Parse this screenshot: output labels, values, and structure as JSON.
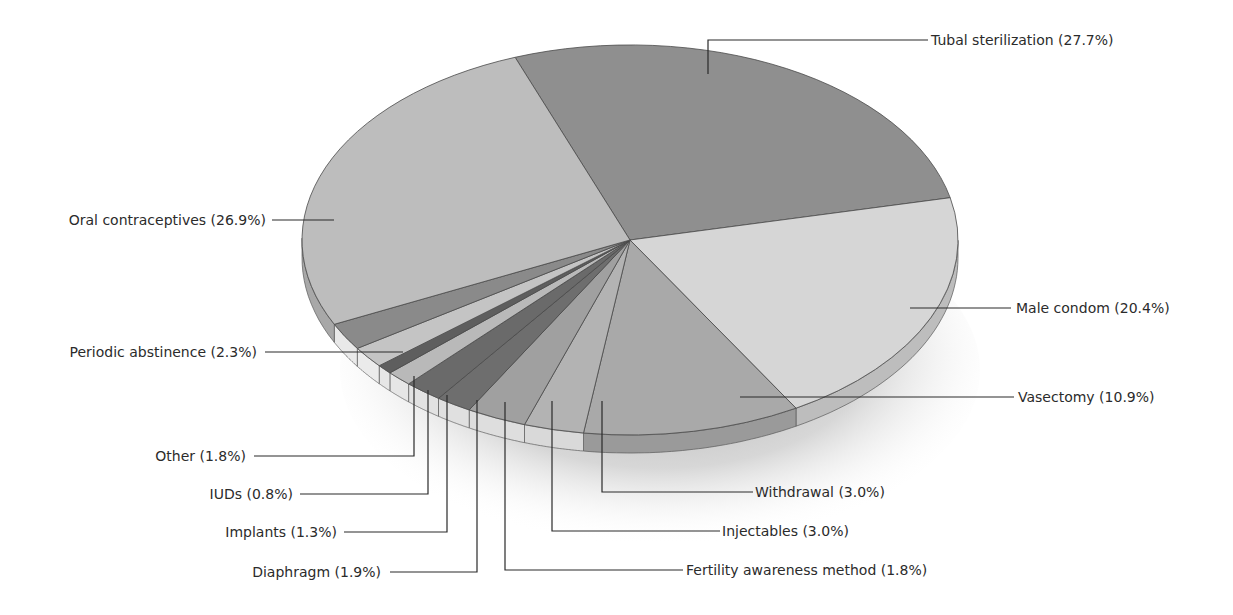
{
  "chart_data": {
    "type": "pie",
    "style": "3d-exploded-perspective",
    "title": "",
    "slices": [
      {
        "label": "Tubal sterilization",
        "value": 27.7,
        "display": "Tubal sterilization (27.7%)",
        "color": "#8f8f8f",
        "side": "#7a7a7a"
      },
      {
        "label": "Male condom",
        "value": 20.4,
        "display": "Male condom (20.4%)",
        "color": "#d6d6d6",
        "side": "#bdbdbd"
      },
      {
        "label": "Vasectomy",
        "value": 10.9,
        "display": "Vasectomy (10.9%)",
        "color": "#a9a9a9",
        "side": "#9a9a9a"
      },
      {
        "label": "Withdrawal",
        "value": 3.0,
        "display": "Withdrawal (3.0%)",
        "color": "#b3b3b3",
        "side": "#d9d9d9"
      },
      {
        "label": "Injectables",
        "value": 3.0,
        "display": "Injectables (3.0%)",
        "color": "#a0a0a0",
        "side": "#dedede"
      },
      {
        "label": "Fertility awareness method",
        "value": 1.8,
        "display": "Fertility awareness method (1.8%)",
        "color": "#6e6e6e",
        "side": "#e0e0e0"
      },
      {
        "label": "Diaphragm",
        "value": 1.9,
        "display": "Diaphragm (1.9%)",
        "color": "#6a6a6a",
        "side": "#e2e2e2"
      },
      {
        "label": "Implants",
        "value": 1.3,
        "display": "Implants (1.3%)",
        "color": "#b9b9b9",
        "side": "#e6e6e6"
      },
      {
        "label": "IUDs",
        "value": 0.8,
        "display": "IUDs (0.8%)",
        "color": "#5e5e5e",
        "side": "#e6e6e6"
      },
      {
        "label": "Other",
        "value": 1.8,
        "display": "Other (1.8%)",
        "color": "#c4c4c4",
        "side": "#ebebeb"
      },
      {
        "label": "Periodic abstinence",
        "value": 2.3,
        "display": "Periodic abstinence (2.3%)",
        "color": "#8a8a8a",
        "side": "#e9e9e9"
      },
      {
        "label": "Oral contraceptives",
        "value": 26.9,
        "display": "Oral contraceptives (26.9%)",
        "color": "#bdbdbd",
        "side": "#a8a8a8"
      }
    ],
    "total_percent": 101.8,
    "legend": "none (direct leader-line labels)",
    "background": "#ffffff"
  },
  "labels": {
    "tubal": "Tubal sterilization (27.7%)",
    "oral": "Oral contraceptives (26.9%)",
    "condom": "Male condom (20.4%)",
    "vasectomy": "Vasectomy (10.9%)",
    "periodic": "Periodic abstinence (2.3%)",
    "other": "Other (1.8%)",
    "iuds": "IUDs (0.8%)",
    "implants": "Implants (1.3%)",
    "diaphragm": "Diaphragm (1.9%)",
    "withdrawal": "Withdrawal (3.0%)",
    "injectables": "Injectables (3.0%)",
    "fertility": "Fertility awareness method (1.8%)"
  }
}
